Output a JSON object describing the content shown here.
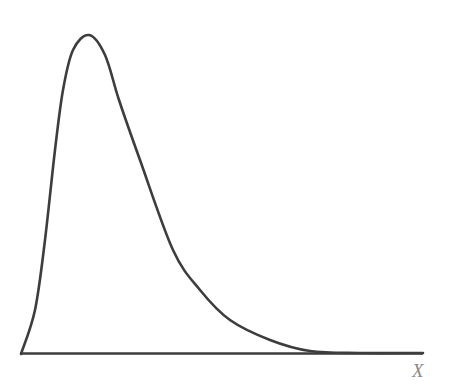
{
  "chart_data": {
    "type": "line",
    "title": "",
    "xlabel": "X",
    "ylabel": "",
    "grid": false,
    "legend": null,
    "axis": {
      "x_visible": true,
      "y_visible": false,
      "ticks": false
    },
    "series": [
      {
        "name": "density",
        "pixel_points": [
          [
            21,
            354
          ],
          [
            35,
            310
          ],
          [
            45,
            240
          ],
          [
            55,
            150
          ],
          [
            63,
            90
          ],
          [
            73,
            50
          ],
          [
            89,
            35
          ],
          [
            105,
            55
          ],
          [
            119,
            100
          ],
          [
            140,
            160
          ],
          [
            173,
            250
          ],
          [
            200,
            290
          ],
          [
            230,
            320
          ],
          [
            270,
            340
          ],
          [
            310,
            351
          ],
          [
            360,
            353
          ],
          [
            423,
            353
          ]
        ]
      }
    ],
    "colors": {
      "curve": "#3d3d3d",
      "axis": "#3d3d3d",
      "label": "#8a8a8a"
    }
  }
}
